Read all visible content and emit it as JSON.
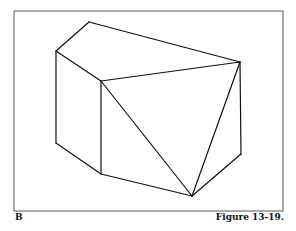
{
  "figure": {
    "panel_label": "B",
    "caption": "Figure 13-19.",
    "frame": {
      "x": 14,
      "y": 11,
      "width": 269,
      "height": 200,
      "stroke": "#555555"
    },
    "line_color": "#111111",
    "vertices": {
      "top_back": [
        89,
        22
      ],
      "left_top": [
        56,
        51
      ],
      "inner_top": [
        101,
        81
      ],
      "right_top": [
        240,
        62
      ],
      "left_bottom": [
        56,
        143
      ],
      "inner_bottom": [
        101,
        174
      ],
      "bottom_front": [
        192,
        196
      ],
      "right_bottom": [
        241,
        154
      ]
    },
    "edges": [
      [
        "top_back",
        "left_top"
      ],
      [
        "top_back",
        "right_top"
      ],
      [
        "left_top",
        "inner_top"
      ],
      [
        "inner_top",
        "right_top"
      ],
      [
        "left_top",
        "left_bottom"
      ],
      [
        "inner_top",
        "inner_bottom"
      ],
      [
        "left_bottom",
        "inner_bottom"
      ],
      [
        "inner_bottom",
        "bottom_front"
      ],
      [
        "inner_top",
        "bottom_front"
      ],
      [
        "right_top",
        "bottom_front"
      ],
      [
        "right_top",
        "right_bottom"
      ],
      [
        "right_bottom",
        "bottom_front"
      ]
    ]
  }
}
